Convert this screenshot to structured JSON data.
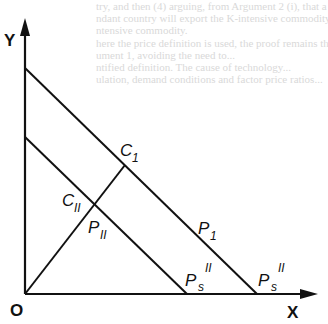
{
  "background_text": [
    "try, and then (4) arguing, from Argument 2 (i), that a",
    "ndant country will export the K-intensive commodity and",
    "ntensive commodity.",
    "here the price definition is used, the proof remains the",
    "ument 1, avoiding the need to...",
    "ntified definition. The cause of technology...",
    "ulation, demand conditions and factor price ratios..."
  ],
  "axes": {
    "y_label": "Y",
    "x_label": "X",
    "origin_label": "O"
  },
  "labels": {
    "c1": {
      "main": "C",
      "sub": "1"
    },
    "c2": {
      "main": "C",
      "sub": "II"
    },
    "p1": {
      "main": "P",
      "sub": "1"
    },
    "p2": {
      "main": "P",
      "sub": "II"
    },
    "ps_inner": {
      "main": "P",
      "sub": "s",
      "sup": "II"
    },
    "ps_outer": {
      "main": "P",
      "sub": "s",
      "sup": "II"
    }
  },
  "colors": {
    "line": "#111111",
    "background": "#ffffff"
  }
}
